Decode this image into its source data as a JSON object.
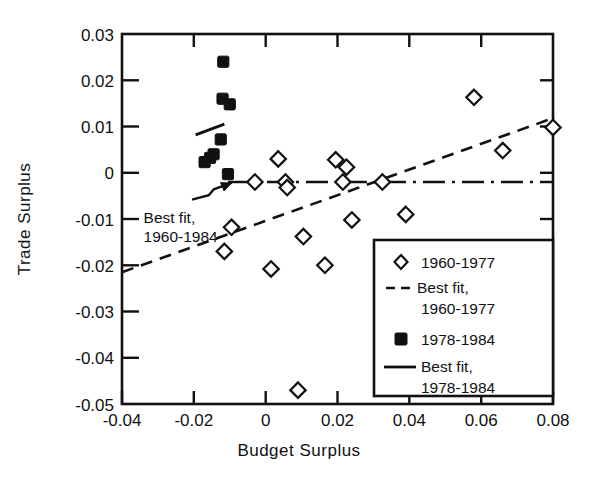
{
  "chart_data": {
    "type": "scatter",
    "title": "",
    "xlabel": "Budget Surplus",
    "ylabel": "Trade Surplus",
    "xlim": [
      -0.04,
      0.08
    ],
    "ylim": [
      -0.05,
      0.03
    ],
    "xticks": [
      -0.04,
      -0.02,
      0,
      0.02,
      0.04,
      0.06,
      0.08
    ],
    "xtick_labels": [
      "-0.04",
      "-0.02",
      "0",
      "0.02",
      "0.04",
      "0.06",
      "0.08"
    ],
    "yticks": [
      0.03,
      0.02,
      0.01,
      0,
      -0.01,
      -0.02,
      -0.03,
      -0.04,
      -0.05
    ],
    "ytick_labels": [
      "0.03",
      "0.02",
      "0.01",
      "0",
      "-0.01",
      "-0.02",
      "-0.03",
      "-0.04",
      "-0.05"
    ],
    "grid": false,
    "legend_position": "lower right",
    "series": [
      {
        "name": "1960-1977",
        "marker": "open-diamond",
        "points": [
          [
            -0.0115,
            -0.017
          ],
          [
            -0.0095,
            -0.0118
          ],
          [
            -0.003,
            -0.002
          ],
          [
            0.0015,
            -0.0208
          ],
          [
            0.0035,
            0.003
          ],
          [
            0.0055,
            -0.002
          ],
          [
            0.006,
            -0.0032
          ],
          [
            0.009,
            -0.047
          ],
          [
            0.0105,
            -0.0138
          ],
          [
            0.0165,
            -0.02
          ],
          [
            0.0195,
            0.0028
          ],
          [
            0.0225,
            0.0012
          ],
          [
            0.0215,
            -0.002
          ],
          [
            0.024,
            -0.0102
          ],
          [
            0.0325,
            -0.002
          ],
          [
            0.039,
            -0.009
          ],
          [
            0.058,
            0.0163
          ],
          [
            0.066,
            0.0048
          ],
          [
            0.08,
            0.0098
          ]
        ]
      },
      {
        "name": "1978-1984",
        "marker": "filled-square",
        "points": [
          [
            -0.0118,
            0.024
          ],
          [
            -0.012,
            0.016
          ],
          [
            -0.01,
            0.0148
          ],
          [
            -0.0125,
            0.0072
          ],
          [
            -0.0145,
            0.004
          ],
          [
            -0.0155,
            0.0032
          ],
          [
            -0.017,
            0.0023
          ],
          [
            -0.0105,
            -0.0003
          ]
        ]
      }
    ],
    "fits": [
      {
        "name": "Best fit, 1960-1977",
        "style": "dashed",
        "x0": -0.04,
        "y0": -0.0215,
        "x1": 0.08,
        "y1": 0.0118
      },
      {
        "name": "Best fit, 1978-1984",
        "style": "solid",
        "x0": -0.0195,
        "y0": 0.0082,
        "x1": -0.0115,
        "y1": 0.0105
      },
      {
        "name": "Best fit, 1960-1984",
        "style": "dashdot",
        "x0": -0.0105,
        "y0": -0.002,
        "x1": 0.08,
        "y1": -0.002
      }
    ],
    "annotations": [
      {
        "label_line1": "Best fit,",
        "label_line2": "1960-1984",
        "text_x": -0.034,
        "text_y": -0.0108,
        "arrow_from_x": -0.0205,
        "arrow_from_y": -0.0058,
        "arrow_to_x": -0.0095,
        "arrow_to_y": -0.0022
      }
    ],
    "legend_entries": [
      {
        "label": "1960-1977",
        "glyph": "open-diamond"
      },
      {
        "label": "Best fit,",
        "label2": "1960-1977",
        "glyph": "dashed-line"
      },
      {
        "label": "1978-1984",
        "glyph": "filled-square"
      },
      {
        "label": "Best fit,",
        "label2": "1978-1984",
        "glyph": "solid-line"
      }
    ]
  },
  "axis": {
    "x_title": "Budget Surplus",
    "y_title": "Trade Surplus"
  },
  "legend": {
    "e0_label": "1960-1977",
    "e1_label": "Best fit,",
    "e1_label2": "1960-1977",
    "e2_label": "1978-1984",
    "e3_label": "Best fit,",
    "e3_label2": "1978-1984"
  },
  "annotation": {
    "line1": "Best fit,",
    "line2": "1960-1984"
  },
  "ticks": {
    "x0": "-0.04",
    "x1": "-0.02",
    "x2": "0",
    "x3": "0.02",
    "x4": "0.04",
    "x5": "0.06",
    "x6": "0.08",
    "y0": "0.03",
    "y1": "0.02",
    "y2": "0.01",
    "y3": "0",
    "y4": "-0.01",
    "y5": "-0.02",
    "y6": "-0.03",
    "y7": "-0.04",
    "y8": "-0.05"
  },
  "colors": {
    "ink": "#111111",
    "background": "#ffffff"
  }
}
